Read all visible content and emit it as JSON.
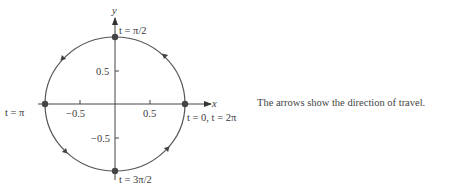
{
  "diagram": {
    "type": "parametric-unit-circle",
    "axes": {
      "x_label": "x",
      "y_label": "y",
      "x_ticks": [
        {
          "value": -0.5,
          "label": "−0.5"
        },
        {
          "value": 0.5,
          "label": "0.5"
        }
      ],
      "y_ticks": [
        {
          "value": 0.5,
          "label": "0.5"
        },
        {
          "value": -0.5,
          "label": "−0.5"
        }
      ]
    },
    "points": [
      {
        "id": "top",
        "x": 0,
        "y": 1,
        "label": "t = π/2"
      },
      {
        "id": "left",
        "x": -1,
        "y": 0,
        "label": "t = π"
      },
      {
        "id": "right",
        "x": 1,
        "y": 0,
        "label": "t = 0, t = 2π"
      },
      {
        "id": "bottom",
        "x": 0,
        "y": -1,
        "label": "t = 3π/2"
      }
    ],
    "direction": "counterclockwise",
    "caption": "The arrows show the direction of travel.",
    "colors": {
      "curve": "#555555",
      "axis": "#444444",
      "point": "#444444"
    }
  }
}
